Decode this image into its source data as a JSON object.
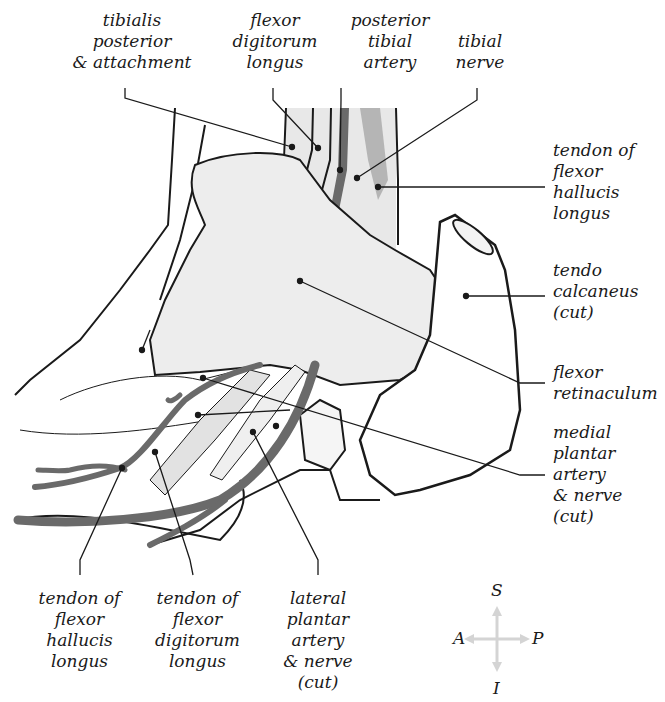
{
  "figure": {
    "type": "anatomical illustration",
    "colors": {
      "outline": "#1a1a1a",
      "tissue_light": "#e4e4e4",
      "tissue_retinaculum": "#ededed",
      "artery": "#6a6a6a",
      "nerve": "#b5b5b5",
      "compass_arrow": "#d4d4d4"
    }
  },
  "labels": {
    "tibialis_posterior": [
      "tibialis",
      "posterior",
      "& attachment"
    ],
    "fdl_top": [
      "flexor",
      "digitorum",
      "longus"
    ],
    "posterior_tibial_artery": [
      "posterior",
      "tibial",
      "artery"
    ],
    "tibial_nerve": [
      "tibial",
      "nerve"
    ],
    "fhl_tendon_right": [
      "tendon of",
      "flexor",
      "hallucis",
      "longus"
    ],
    "tendo_calcaneus": [
      "tendo",
      "calcaneus",
      "(cut)"
    ],
    "flexor_retinaculum": [
      "flexor",
      "retinaculum"
    ],
    "medial_plantar": [
      "medial",
      "plantar",
      "artery",
      "& nerve",
      "(cut)"
    ],
    "fhl_tendon_bottom": [
      "tendon of",
      "flexor",
      "hallucis",
      "longus"
    ],
    "fdl_tendon_bottom": [
      "tendon of",
      "flexor",
      "digitorum",
      "longus"
    ],
    "lateral_plantar": [
      "lateral",
      "plantar",
      "artery",
      "& nerve",
      "(cut)"
    ]
  },
  "compass": {
    "superior": "S",
    "inferior": "I",
    "anterior": "A",
    "posterior": "P"
  }
}
